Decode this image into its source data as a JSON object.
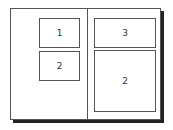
{
  "diagram": {
    "title": "",
    "left_panel": {
      "boxes": [
        {
          "label": "1"
        },
        {
          "label": "2"
        }
      ]
    },
    "right_panel": {
      "boxes": [
        {
          "label": "3"
        },
        {
          "label": "2"
        }
      ]
    }
  }
}
